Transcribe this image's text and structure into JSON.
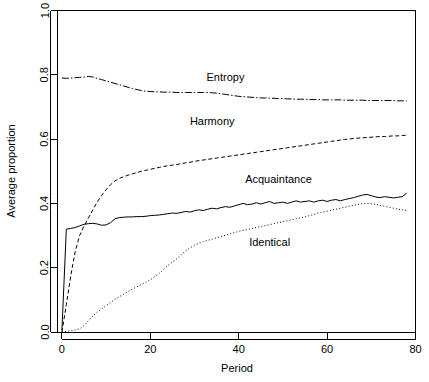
{
  "chart_data": {
    "type": "line",
    "title": "",
    "xlabel": "Period",
    "ylabel": "Average proportion",
    "xlim": [
      -1,
      80
    ],
    "ylim": [
      0.0,
      1.0
    ],
    "xticks": [
      0,
      20,
      40,
      60,
      80
    ],
    "xtick_labels": [
      "0",
      "20",
      "40",
      "60",
      "80"
    ],
    "yticks": [
      0.0,
      0.2,
      0.4,
      0.6,
      0.8,
      1.0
    ],
    "ytick_labels": [
      "0.0",
      "0.2",
      "0.4",
      "0.6",
      "0.8",
      "1.0"
    ],
    "grid": false,
    "legend": "inline-labels",
    "background": "#ffffff",
    "line_color": "#000000",
    "x": [
      0,
      1,
      2,
      3,
      4,
      5,
      6,
      7,
      8,
      9,
      10,
      11,
      12,
      13,
      14,
      15,
      16,
      17,
      18,
      19,
      20,
      21,
      22,
      23,
      24,
      25,
      26,
      27,
      28,
      29,
      30,
      31,
      32,
      33,
      34,
      35,
      36,
      37,
      38,
      39,
      40,
      41,
      42,
      43,
      44,
      45,
      46,
      47,
      48,
      49,
      50,
      51,
      52,
      53,
      54,
      55,
      56,
      57,
      58,
      59,
      60,
      61,
      62,
      63,
      64,
      65,
      66,
      67,
      68,
      69,
      70,
      71,
      72,
      73,
      74,
      75,
      76,
      77,
      78
    ],
    "series": [
      {
        "name": "Entropy",
        "style": "dashdot",
        "dasharray": "7,2,1.5,2",
        "label_x": 37,
        "label_y": 0.782,
        "values": [
          0.79,
          0.789,
          0.79,
          0.791,
          0.792,
          0.793,
          0.795,
          0.793,
          0.789,
          0.785,
          0.781,
          0.777,
          0.773,
          0.769,
          0.765,
          0.761,
          0.757,
          0.754,
          0.751,
          0.749,
          0.748,
          0.747,
          0.747,
          0.746,
          0.746,
          0.746,
          0.745,
          0.745,
          0.745,
          0.745,
          0.745,
          0.745,
          0.745,
          0.745,
          0.744,
          0.743,
          0.741,
          0.739,
          0.737,
          0.735,
          0.733,
          0.732,
          0.731,
          0.73,
          0.729,
          0.728,
          0.728,
          0.727,
          0.727,
          0.726,
          0.726,
          0.725,
          0.725,
          0.724,
          0.724,
          0.724,
          0.723,
          0.723,
          0.723,
          0.722,
          0.722,
          0.722,
          0.722,
          0.722,
          0.721,
          0.721,
          0.721,
          0.721,
          0.721,
          0.72,
          0.72,
          0.72,
          0.72,
          0.72,
          0.72,
          0.72,
          0.719,
          0.719,
          0.719
        ]
      },
      {
        "name": "Harmony",
        "style": "dashed",
        "dasharray": "4,2.5",
        "label_x": 34,
        "label_y": 0.645,
        "values": [
          0.0,
          0.085,
          0.175,
          0.25,
          0.3,
          0.33,
          0.355,
          0.38,
          0.405,
          0.425,
          0.443,
          0.458,
          0.47,
          0.478,
          0.483,
          0.488,
          0.492,
          0.496,
          0.5,
          0.503,
          0.506,
          0.509,
          0.512,
          0.515,
          0.517,
          0.519,
          0.521,
          0.524,
          0.526,
          0.528,
          0.531,
          0.533,
          0.535,
          0.537,
          0.539,
          0.541,
          0.543,
          0.545,
          0.547,
          0.549,
          0.551,
          0.553,
          0.555,
          0.557,
          0.559,
          0.561,
          0.563,
          0.565,
          0.567,
          0.569,
          0.571,
          0.573,
          0.575,
          0.577,
          0.579,
          0.581,
          0.583,
          0.585,
          0.587,
          0.589,
          0.591,
          0.593,
          0.595,
          0.597,
          0.599,
          0.6,
          0.602,
          0.603,
          0.604,
          0.605,
          0.606,
          0.607,
          0.608,
          0.608,
          0.609,
          0.61,
          0.61,
          0.611,
          0.612
        ]
      },
      {
        "name": "Acquaintance",
        "style": "solid",
        "dasharray": "none",
        "label_x": 49,
        "label_y": 0.462,
        "values": [
          0.005,
          0.32,
          0.322,
          0.325,
          0.33,
          0.335,
          0.337,
          0.338,
          0.336,
          0.332,
          0.333,
          0.34,
          0.352,
          0.356,
          0.357,
          0.358,
          0.358,
          0.359,
          0.359,
          0.36,
          0.362,
          0.363,
          0.364,
          0.366,
          0.368,
          0.37,
          0.369,
          0.372,
          0.375,
          0.373,
          0.377,
          0.38,
          0.378,
          0.382,
          0.385,
          0.383,
          0.387,
          0.39,
          0.388,
          0.392,
          0.396,
          0.4,
          0.396,
          0.398,
          0.402,
          0.398,
          0.402,
          0.406,
          0.4,
          0.402,
          0.404,
          0.4,
          0.404,
          0.408,
          0.404,
          0.406,
          0.408,
          0.404,
          0.408,
          0.41,
          0.406,
          0.41,
          0.412,
          0.408,
          0.412,
          0.415,
          0.418,
          0.422,
          0.426,
          0.428,
          0.424,
          0.42,
          0.418,
          0.421,
          0.419,
          0.417,
          0.419,
          0.421,
          0.432
        ]
      },
      {
        "name": "Identical",
        "style": "dotted",
        "dasharray": "1,2.2",
        "label_x": 47,
        "label_y": 0.268,
        "values": [
          0.0,
          0.002,
          0.004,
          0.006,
          0.01,
          0.02,
          0.035,
          0.05,
          0.062,
          0.072,
          0.082,
          0.092,
          0.102,
          0.11,
          0.118,
          0.126,
          0.134,
          0.141,
          0.148,
          0.155,
          0.162,
          0.172,
          0.182,
          0.195,
          0.207,
          0.218,
          0.228,
          0.24,
          0.252,
          0.262,
          0.27,
          0.276,
          0.281,
          0.285,
          0.289,
          0.293,
          0.297,
          0.301,
          0.305,
          0.309,
          0.313,
          0.316,
          0.319,
          0.322,
          0.325,
          0.328,
          0.331,
          0.334,
          0.337,
          0.34,
          0.343,
          0.346,
          0.349,
          0.352,
          0.355,
          0.358,
          0.362,
          0.366,
          0.37,
          0.373,
          0.376,
          0.379,
          0.382,
          0.385,
          0.388,
          0.391,
          0.394,
          0.397,
          0.399,
          0.4,
          0.399,
          0.397,
          0.394,
          0.391,
          0.388,
          0.385,
          0.382,
          0.38,
          0.378
        ]
      }
    ]
  }
}
